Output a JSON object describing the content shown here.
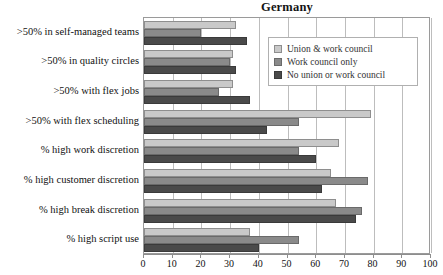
{
  "chart_data": {
    "type": "bar",
    "orientation": "horizontal",
    "title": "Germany",
    "xlabel": "",
    "ylabel": "",
    "xlim": [
      0,
      100
    ],
    "xticks": [
      "0",
      "10",
      "20",
      "30",
      "40",
      "50",
      "60",
      "70",
      "80",
      "90",
      "100"
    ],
    "grid": true,
    "legend_position": "upper right (inside plot)",
    "categories": [
      ">50% in self-managed teams",
      ">50% in quality circles",
      ">50% with flex jobs",
      ">50% with flex scheduling",
      "% high work discretion",
      "% high customer discretion",
      "% high break discretion",
      "% high script use"
    ],
    "series": [
      {
        "name": "Union & work council",
        "color": "#c9c9c9",
        "values": [
          32,
          31,
          31,
          79,
          68,
          65,
          67,
          37
        ]
      },
      {
        "name": "Work council only",
        "color": "#8a8a8a",
        "values": [
          20,
          30,
          26,
          54,
          54,
          78,
          76,
          54
        ]
      },
      {
        "name": "No union or work council",
        "color": "#4a4a4a",
        "values": [
          36,
          32,
          37,
          43,
          60,
          62,
          74,
          40
        ]
      }
    ]
  }
}
